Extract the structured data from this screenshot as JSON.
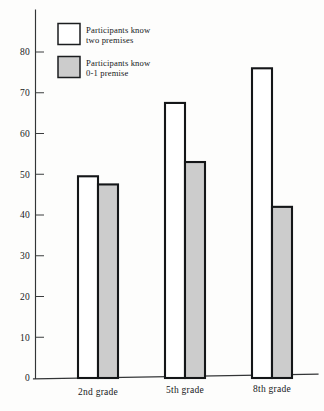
{
  "chart_data": {
    "type": "bar",
    "title": "",
    "subtitle": "",
    "xlabel": "",
    "ylabel": "",
    "categories": [
      "2nd grade",
      "5th grade",
      "8th grade"
    ],
    "series": [
      {
        "name": "Participants know two premises",
        "values": [
          49.5,
          67.5,
          76
        ],
        "color": "#ffffff",
        "edge_color": "#141618"
      },
      {
        "name": "Participants know 0-1 premise",
        "values": [
          47.5,
          53,
          42
        ],
        "color": "#cccccc",
        "edge_color": "#141618"
      }
    ],
    "ylim": [
      0,
      88
    ],
    "yticks": [
      0,
      10,
      20,
      30,
      40,
      50,
      60,
      70,
      80
    ],
    "ytick_labels": [
      "0",
      "10",
      "20",
      "30",
      "40",
      "50",
      "60",
      "70",
      "80"
    ],
    "grid": false,
    "legend_position": "upper left"
  },
  "legend": {
    "entries": [
      {
        "swatch": "white-swatch",
        "line1": "Participants know",
        "line2": "two premises"
      },
      {
        "swatch": "gray-swatch",
        "line1": "Participants know",
        "line2": "0-1 premise"
      }
    ]
  },
  "colors": {
    "bar_white_fill": "#ffffff",
    "bar_gray_fill": "#cccccc",
    "bar_edge": "#141618",
    "axis": "#333537",
    "text": "#16181a",
    "background": "#fdfdfc"
  }
}
